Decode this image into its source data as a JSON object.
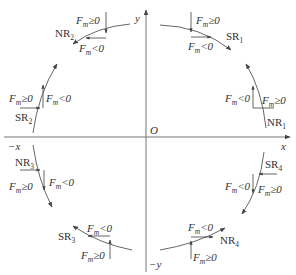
{
  "diagram": {
    "title": "",
    "axes": {
      "origin": "O",
      "x_pos": "x",
      "x_neg": "−x",
      "y_pos": "y",
      "y_neg": "−y"
    },
    "force_labels": {
      "fm_ge": "≥0",
      "fm_lt": "<0",
      "F": "F",
      "m": "m"
    },
    "arcs": [
      {
        "id": "SR1",
        "base": "SR",
        "sub": "1",
        "quadrant": 1,
        "direction": "clockwise"
      },
      {
        "id": "NR1",
        "base": "NR",
        "sub": "1",
        "quadrant": 1,
        "direction": "counterclockwise"
      },
      {
        "id": "NR2",
        "base": "NR",
        "sub": "2",
        "quadrant": 2,
        "direction": "counterclockwise"
      },
      {
        "id": "SR2",
        "base": "SR",
        "sub": "2",
        "quadrant": 2,
        "direction": "clockwise"
      },
      {
        "id": "NR3",
        "base": "NR",
        "sub": "3",
        "quadrant": 3,
        "direction": "counterclockwise"
      },
      {
        "id": "SR3",
        "base": "SR",
        "sub": "3",
        "quadrant": 3,
        "direction": "clockwise"
      },
      {
        "id": "SR4",
        "base": "SR",
        "sub": "4",
        "quadrant": 4,
        "direction": "clockwise"
      },
      {
        "id": "NR4",
        "base": "NR",
        "sub": "4",
        "quadrant": 4,
        "direction": "counterclockwise"
      }
    ]
  }
}
